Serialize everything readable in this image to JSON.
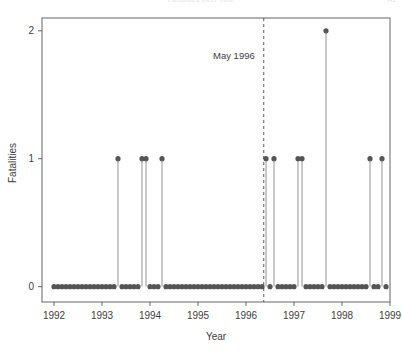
{
  "page": {
    "title_cut_off": "Fatalities over time",
    "corner_cut_off": "A1"
  },
  "chart_data": {
    "type": "scatter",
    "title": "",
    "xlabel": "Year",
    "ylabel": "Fatalities",
    "xlim": [
      1991.75,
      1999.0
    ],
    "ylim": [
      -0.12,
      2.1
    ],
    "xticks": [
      1992,
      1993,
      1994,
      1995,
      1996,
      1997,
      1998,
      1999
    ],
    "xtick_labels": [
      "1992",
      "1993",
      "1994",
      "1995",
      "1996",
      "1997",
      "1998",
      "1999"
    ],
    "yticks": [
      0,
      1,
      2
    ],
    "ytick_labels": [
      "0",
      "1",
      "2"
    ],
    "grid": false,
    "legend": null,
    "marker_color": "#555555",
    "stem_color": "#777777",
    "frame_color": "#555555",
    "annotations": [
      {
        "text": "May 1996",
        "x": 1996.37,
        "y": 1.78,
        "line_style": "dashed",
        "line_x": 1996.37
      }
    ],
    "series": [
      {
        "name": "Fatalities",
        "x": [
          1992.0,
          1992.083,
          1992.167,
          1992.25,
          1992.333,
          1992.417,
          1992.5,
          1992.583,
          1992.667,
          1992.75,
          1992.833,
          1992.917,
          1993.0,
          1993.083,
          1993.167,
          1993.25,
          1993.333,
          1993.417,
          1993.5,
          1993.583,
          1993.667,
          1993.75,
          1993.833,
          1993.917,
          1994.0,
          1994.083,
          1994.167,
          1994.25,
          1994.333,
          1994.417,
          1994.5,
          1994.583,
          1994.667,
          1994.75,
          1994.833,
          1994.917,
          1995.0,
          1995.083,
          1995.167,
          1995.25,
          1995.333,
          1995.417,
          1995.5,
          1995.583,
          1995.667,
          1995.75,
          1995.833,
          1995.917,
          1996.0,
          1996.083,
          1996.167,
          1996.25,
          1996.333,
          1996.417,
          1996.5,
          1996.583,
          1996.667,
          1996.75,
          1996.833,
          1996.917,
          1997.0,
          1997.083,
          1997.167,
          1997.25,
          1997.333,
          1997.417,
          1997.5,
          1997.583,
          1997.667,
          1997.75,
          1997.833,
          1997.917,
          1998.0,
          1998.083,
          1998.167,
          1998.25,
          1998.333,
          1998.417,
          1998.5,
          1998.583,
          1998.667,
          1998.75,
          1998.833,
          1998.917
        ],
        "y": [
          0,
          0,
          0,
          0,
          0,
          0,
          0,
          0,
          0,
          0,
          0,
          0,
          0,
          0,
          0,
          0,
          1,
          0,
          0,
          0,
          0,
          0,
          1,
          1,
          0,
          0,
          0,
          1,
          0,
          0,
          0,
          0,
          0,
          0,
          0,
          0,
          0,
          0,
          0,
          0,
          0,
          0,
          0,
          0,
          0,
          0,
          0,
          0,
          0,
          0,
          0,
          0,
          0,
          1,
          0,
          1,
          0,
          0,
          0,
          0,
          0,
          1,
          1,
          0,
          0,
          0,
          0,
          0,
          2,
          0,
          0,
          0,
          0,
          0,
          0,
          0,
          0,
          0,
          0,
          1,
          0,
          0,
          1,
          0
        ]
      }
    ]
  }
}
